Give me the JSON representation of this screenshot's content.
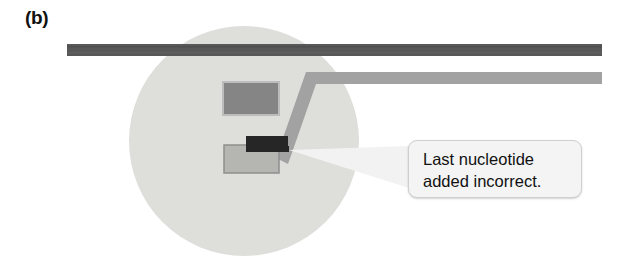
{
  "figure": {
    "panel_label": "(b)",
    "background_color": "#ffffff",
    "width": 632,
    "height": 280
  },
  "magnifier": {
    "name": "magnified-region-circle",
    "color": "#dededb",
    "center_x": 244,
    "center_y": 141,
    "radius": 115
  },
  "strands": {
    "template_strand": {
      "label": "template-strand",
      "color": "#585858",
      "x1": 67,
      "x2": 602,
      "y": 44,
      "thickness": 12
    },
    "new_strand": {
      "label": "new-daughter-strand",
      "color": "#a2a2a2",
      "x_right": 602,
      "y_horizontal": 70,
      "bend_x": 312,
      "thickness": 12
    }
  },
  "polymerase": {
    "upper_domain": {
      "name": "polymerase-upper-domain",
      "fill": "#858585",
      "stroke": "#bcbcbc",
      "x": 223,
      "y": 82,
      "width": 56,
      "height": 33
    },
    "lower_domain": {
      "name": "polymerase-lower-domain",
      "fill": "#b5b5b2",
      "stroke": "#8f8f8f",
      "x": 224,
      "y": 145,
      "width": 55,
      "height": 28
    }
  },
  "mismatched_nucleotide": {
    "name": "mismatched-nucleotide",
    "color": "#262626",
    "x": 246,
    "y": 136,
    "width": 42,
    "height": 16
  },
  "callout": {
    "name": "callout-last-nucleotide-incorrect",
    "text": "Last nucleotide\nadded incorrect.",
    "line_1": "Last nucleotide",
    "line_2": "added incorrect.",
    "box": {
      "x": 408,
      "y": 140,
      "width": 174,
      "height": 58,
      "fill": "#f4f4f4",
      "border": "#cfcfcf",
      "radius": 9
    },
    "pointer": {
      "name": "callout-pointer",
      "fill": "#f2f2f2",
      "tip_x": 289,
      "tip_y": 150,
      "target": "mismatched-nucleotide"
    }
  },
  "colors": {
    "dark_strand": "#585858",
    "light_strand": "#a2a2a2",
    "circle": "#dededb",
    "nucleotide_dark": "#262626",
    "box_upper": "#858585",
    "box_lower": "#b5b5b2",
    "text": "#111111"
  }
}
